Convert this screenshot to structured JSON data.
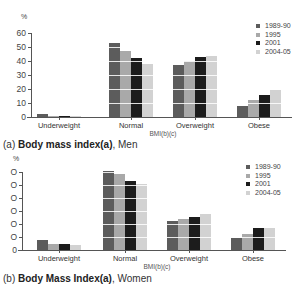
{
  "colors": {
    "1989-90": "#5c5c5c",
    "1995": "#a9a9a9",
    "2001": "#1c1c1c",
    "2004-05": "#d2d2d2"
  },
  "chart_data": [
    {
      "type": "bar",
      "title": "(a) Body mass index(a), Men",
      "caption_prefix": "(a) ",
      "caption_bold": "Body mass index(a)",
      "caption_suffix": ", Men",
      "xlabel": "BMI(b)(c)",
      "ylabel": "%",
      "ylim": [
        0,
        60
      ],
      "yticks": [
        0,
        10,
        20,
        30,
        40,
        50,
        60
      ],
      "ytick_labels": [
        "0",
        "10",
        "20",
        "30",
        "40",
        "50",
        "60"
      ],
      "grid": true,
      "legend_position": "top-right",
      "categories": [
        "Underweight",
        "Normal",
        "Overweight",
        "Obese"
      ],
      "series": [
        {
          "name": "1989-90",
          "values": [
            2.5,
            53,
            37,
            8
          ]
        },
        {
          "name": "1995",
          "values": [
            1,
            47,
            40,
            12
          ]
        },
        {
          "name": "2001",
          "values": [
            1,
            42,
            43,
            16
          ]
        },
        {
          "name": "2004-05",
          "values": [
            0.5,
            38,
            43.5,
            19
          ]
        }
      ]
    },
    {
      "type": "bar",
      "title": "(b) Body Mass Index(a), Women",
      "caption_prefix": "(b) ",
      "caption_bold": "Body Mass Index(a)",
      "caption_suffix": ", Women",
      "xlabel": "BMI(b)(c)",
      "ylabel": "%",
      "ylim": [
        0,
        60
      ],
      "yticks": [
        0,
        10,
        20,
        30,
        40,
        50,
        60
      ],
      "ytick_labels": [
        "0",
        "O",
        "O",
        "O",
        "O",
        "O",
        "O"
      ],
      "grid": true,
      "legend_position": "top-right",
      "categories": [
        "Underweight",
        "Normal",
        "Overweight",
        "Obese"
      ],
      "series": [
        {
          "name": "1989-90",
          "values": [
            8,
            60.5,
            22,
            9.5
          ]
        },
        {
          "name": "1995",
          "values": [
            5,
            58.5,
            24,
            12
          ]
        },
        {
          "name": "2001",
          "values": [
            4.5,
            53,
            25.5,
            17
          ]
        },
        {
          "name": "2004-05",
          "values": [
            3.5,
            51,
            28,
            17
          ]
        }
      ]
    }
  ]
}
